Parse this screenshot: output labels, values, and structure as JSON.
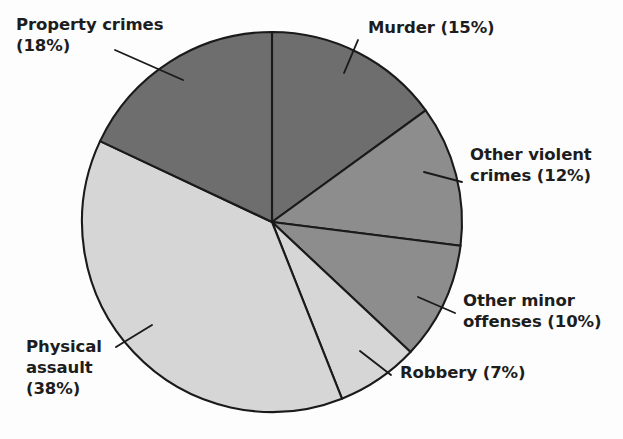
{
  "figure": {
    "background": "#fdfdfd",
    "text_color": "#1d1d1d"
  },
  "chart_data": {
    "type": "pie",
    "title": "",
    "subtitle": "",
    "xlabel": "",
    "ylabel": "",
    "grid": false,
    "legend_position": "none",
    "label_format": "{name} ({value}%)",
    "start_angle_deg": 0,
    "direction": "clockwise",
    "units": "percent",
    "total": 100,
    "categories": [
      "Murder",
      "Other violent crimes",
      "Other minor offenses",
      "Robbery",
      "Physical assault",
      "Property crimes"
    ],
    "values": [
      15,
      12,
      10,
      7,
      38,
      18
    ],
    "colors": [
      "#6e6e6e",
      "#8d8d8d",
      "#8d8d8d",
      "#d6d6d6",
      "#d6d6d6",
      "#6e6e6e"
    ],
    "slices": [
      {
        "name": "Murder",
        "value": 15,
        "label": "Murder (15%)",
        "color": "#6e6e6e",
        "start_deg": 0,
        "end_deg": 54
      },
      {
        "name": "Other violent crimes",
        "value": 12,
        "label": "Other violent\ncrimes (12%)",
        "color": "#8d8d8d",
        "start_deg": 54,
        "end_deg": 97.2
      },
      {
        "name": "Other minor offenses",
        "value": 10,
        "label": "Other minor\noffenses (10%)",
        "color": "#8d8d8d",
        "start_deg": 97.2,
        "end_deg": 133.2
      },
      {
        "name": "Robbery",
        "value": 7,
        "label": "Robbery (7%)",
        "color": "#d6d6d6",
        "start_deg": 133.2,
        "end_deg": 158.4
      },
      {
        "name": "Physical assault",
        "value": 38,
        "label": "Physical\nassault\n(38%)",
        "color": "#d6d6d6",
        "start_deg": 158.4,
        "end_deg": 295.2
      },
      {
        "name": "Property crimes",
        "value": 18,
        "label": "Property crimes\n(18%)",
        "color": "#6e6e6e",
        "start_deg": 295.2,
        "end_deg": 360
      }
    ]
  }
}
